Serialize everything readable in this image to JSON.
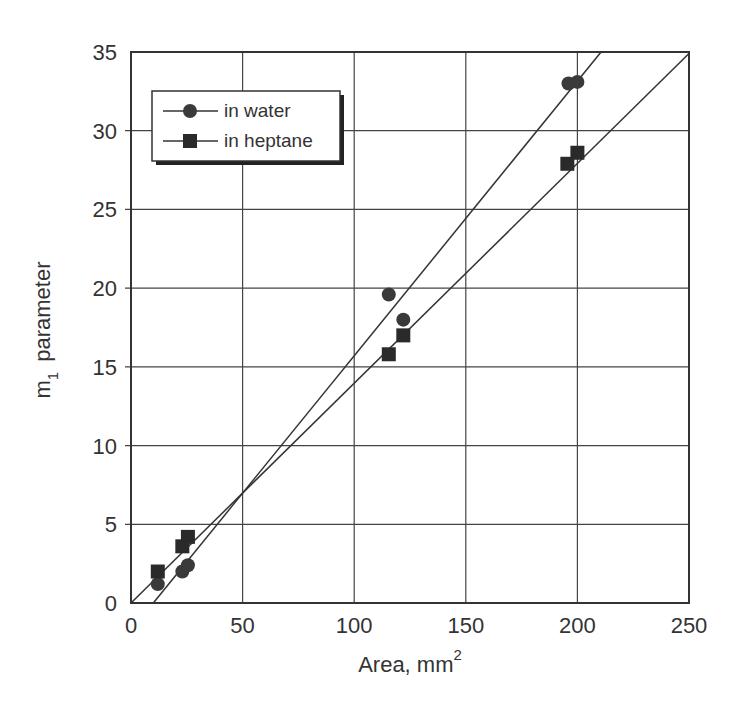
{
  "chart_data": {
    "type": "scatter",
    "title": "",
    "xlabel": "Area, mm",
    "xlabel_superscript": "2",
    "ylabel": "m",
    "ylabel_subscript": "1",
    "ylabel_suffix": "parameter",
    "xlim": [
      0,
      250
    ],
    "ylim": [
      0,
      35
    ],
    "xticks": [
      0,
      50,
      100,
      150,
      200,
      250
    ],
    "yticks": [
      0,
      5,
      10,
      15,
      20,
      25,
      30,
      35
    ],
    "grid": true,
    "legend_position": "upper left",
    "series": [
      {
        "name": "in water",
        "marker": "circle",
        "color": "#3a3a3a",
        "points": [
          {
            "x": 12,
            "y": 1.2
          },
          {
            "x": 23,
            "y": 2.0
          },
          {
            "x": 25.5,
            "y": 2.4
          },
          {
            "x": 115.5,
            "y": 19.6
          },
          {
            "x": 122,
            "y": 18.0
          },
          {
            "x": 196,
            "y": 33.0
          },
          {
            "x": 200,
            "y": 33.1
          }
        ],
        "fit_line": {
          "x0": 10,
          "y0": 0,
          "x1": 210.6,
          "y1": 35
        }
      },
      {
        "name": "in heptane",
        "marker": "square",
        "color": "#2a2a2a",
        "points": [
          {
            "x": 12,
            "y": 2.0
          },
          {
            "x": 23,
            "y": 3.6
          },
          {
            "x": 25.5,
            "y": 4.2
          },
          {
            "x": 115.5,
            "y": 15.8
          },
          {
            "x": 122,
            "y": 17.0
          },
          {
            "x": 195.5,
            "y": 27.9
          },
          {
            "x": 200,
            "y": 28.6
          }
        ],
        "fit_line": {
          "x0": 0,
          "y0": 0,
          "x1": 250,
          "y1": 34.9
        }
      }
    ]
  },
  "legend": {
    "items": [
      {
        "label": "in water",
        "marker": "circle"
      },
      {
        "label": "in heptane",
        "marker": "square"
      }
    ]
  },
  "axes": {
    "x_tick_labels": [
      "0",
      "50",
      "100",
      "150",
      "200",
      "250"
    ],
    "y_tick_labels": [
      "0",
      "5",
      "10",
      "15",
      "20",
      "25",
      "30",
      "35"
    ]
  }
}
